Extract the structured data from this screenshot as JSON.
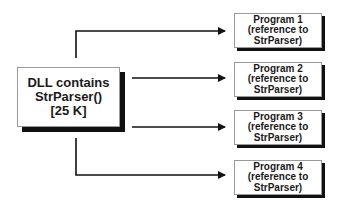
{
  "diagram": {
    "source": {
      "lines": [
        "DLL contains",
        "StrParser()",
        "[25 K]"
      ]
    },
    "targets": [
      {
        "lines": [
          "Program 1",
          "(reference to",
          "StrParser)"
        ]
      },
      {
        "lines": [
          "Program 2",
          "(reference to",
          "StrParser)"
        ]
      },
      {
        "lines": [
          "Program 3",
          "(reference to",
          "StrParser)"
        ]
      },
      {
        "lines": [
          "Program 4",
          "(reference to",
          "StrParser)"
        ]
      }
    ],
    "edges": [
      {
        "from": "source",
        "to": "Program 1"
      },
      {
        "from": "source",
        "to": "Program 2"
      },
      {
        "from": "source",
        "to": "Program 3"
      },
      {
        "from": "source",
        "to": "Program 4"
      }
    ]
  }
}
